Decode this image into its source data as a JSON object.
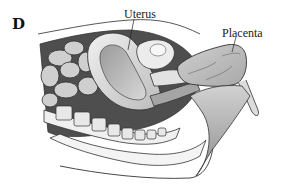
{
  "figure": {
    "panel_letter": "D",
    "labels": {
      "uterus": "Uterus",
      "placenta": "Placenta"
    },
    "colors": {
      "background": "#ffffff",
      "outline": "#333333",
      "tissue_light": "#e6e6e6",
      "tissue_mid": "#bdbdbd",
      "tissue_dark": "#5a5a5a"
    }
  }
}
